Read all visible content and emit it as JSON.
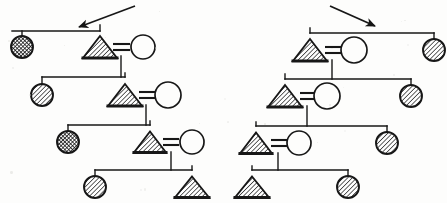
{
  "figure": {
    "background_color": "#fdfdfc",
    "ink_color": "#171717",
    "line_width": 1.4,
    "symbol_legend": [
      {
        "key": "triangle-hatched",
        "shape": "triangle",
        "fill": "diagonal-hatch",
        "meaning": "affected male"
      },
      {
        "key": "circle-open",
        "shape": "circle",
        "fill": "none",
        "meaning": "unaffected female"
      },
      {
        "key": "circle-hatched",
        "shape": "circle",
        "fill": "diagonal-hatch",
        "meaning": "affected female"
      },
      {
        "key": "circle-crosshatched",
        "shape": "circle",
        "fill": "cross-hatch",
        "meaning": "heavily affected female"
      }
    ],
    "mating_symbol": "=",
    "annotations": [
      {
        "name": "proband-arrow-left",
        "direction": "down-left",
        "x1": 135,
        "y1": 6,
        "x2": 79,
        "y2": 27
      },
      {
        "name": "proband-arrow-right",
        "direction": "down-right",
        "x1": 330,
        "y1": 6,
        "x2": 375,
        "y2": 26
      }
    ]
  },
  "pedigrees": [
    {
      "name": "left-pedigree",
      "cascade": "down-right",
      "generations": [
        {
          "label": "I",
          "sibship_line": {
            "x1": 12,
            "x2": 100,
            "y": 31
          },
          "members": [
            {
              "name": "gen1-female-hatched",
              "symbol": "circle-crosshatched",
              "cx": 22,
              "cy": 47,
              "r": 11,
              "drop_from": 31
            },
            {
              "name": "gen1-male-affected",
              "symbol": "triangle-hatched",
              "cx": 100,
              "cy": 47,
              "half_w": 17,
              "h": 22,
              "drop_from": 31
            },
            {
              "name": "gen1-mate-female",
              "symbol": "circle-open",
              "cx": 143,
              "cy": 47,
              "r": 12
            }
          ],
          "mating": {
            "name": "mating-bar-gen1",
            "x1": 113,
            "x2": 130,
            "y": 47,
            "label": "="
          },
          "descent": {
            "x": 121,
            "y1": 56,
            "y2": 77
          }
        },
        {
          "label": "II",
          "sibship_line": {
            "x1": 42,
            "x2": 125,
            "y": 77
          },
          "members": [
            {
              "name": "gen2-female-affected",
              "symbol": "circle-hatched",
              "cx": 42,
              "cy": 95,
              "r": 11,
              "drop_from": 77
            },
            {
              "name": "gen2-male-affected",
              "symbol": "triangle-hatched",
              "cx": 125,
              "cy": 95,
              "half_w": 17,
              "h": 22,
              "drop_from": 77
            },
            {
              "name": "gen2-mate-female",
              "symbol": "circle-open",
              "cx": 168,
              "cy": 95,
              "r": 13
            }
          ],
          "mating": {
            "name": "mating-bar-gen2",
            "x1": 139,
            "x2": 155,
            "y": 95,
            "label": "="
          },
          "descent": {
            "x": 146,
            "y1": 105,
            "y2": 125
          }
        },
        {
          "label": "III",
          "sibship_line": {
            "x1": 68,
            "x2": 150,
            "y": 125
          },
          "members": [
            {
              "name": "gen3-female-affected",
              "symbol": "circle-crosshatched",
              "cx": 68,
              "cy": 142,
              "r": 11,
              "drop_from": 125
            },
            {
              "name": "gen3-male-affected",
              "symbol": "triangle-hatched",
              "cx": 150,
              "cy": 142,
              "half_w": 16,
              "h": 21,
              "drop_from": 125
            },
            {
              "name": "gen3-mate-female",
              "symbol": "circle-open",
              "cx": 192,
              "cy": 142,
              "r": 12
            }
          ],
          "mating": {
            "name": "mating-bar-gen3",
            "x1": 163,
            "x2": 179,
            "y": 142,
            "label": "="
          },
          "descent": {
            "x": 171,
            "y1": 152,
            "y2": 170
          }
        },
        {
          "label": "IV",
          "sibship_line": {
            "x1": 95,
            "x2": 192,
            "y": 170
          },
          "members": [
            {
              "name": "gen4-female-affected",
              "symbol": "circle-hatched",
              "cx": 95,
              "cy": 187,
              "r": 11,
              "drop_from": 170
            },
            {
              "name": "gen4-male-affected",
              "symbol": "triangle-hatched",
              "cx": 192,
              "cy": 187,
              "half_w": 17,
              "h": 21,
              "drop_from": 170
            }
          ]
        }
      ]
    },
    {
      "name": "right-pedigree",
      "cascade": "down-left",
      "generations": [
        {
          "label": "I",
          "sibship_line": {
            "x1": 310,
            "x2": 434,
            "y": 33
          },
          "members": [
            {
              "name": "gen1-male-affected",
              "symbol": "triangle-hatched",
              "cx": 310,
              "cy": 50,
              "half_w": 17,
              "h": 22,
              "drop_from": 33
            },
            {
              "name": "gen1-mate-female",
              "symbol": "circle-open",
              "cx": 354,
              "cy": 50,
              "r": 13
            },
            {
              "name": "gen1-female-affected",
              "symbol": "circle-hatched",
              "cx": 434,
              "cy": 50,
              "r": 11,
              "drop_from": 33
            }
          ],
          "mating": {
            "name": "mating-bar-gen1",
            "x1": 325,
            "x2": 341,
            "y": 50,
            "label": "="
          },
          "descent": {
            "x": 332,
            "y1": 60,
            "y2": 79
          }
        },
        {
          "label": "II",
          "sibship_line": {
            "x1": 285,
            "x2": 411,
            "y": 79
          },
          "members": [
            {
              "name": "gen2-male-affected",
              "symbol": "triangle-hatched",
              "cx": 285,
              "cy": 96,
              "half_w": 17,
              "h": 22,
              "drop_from": 79
            },
            {
              "name": "gen2-mate-female",
              "symbol": "circle-open",
              "cx": 327,
              "cy": 96,
              "r": 13
            },
            {
              "name": "gen2-female-affected",
              "symbol": "circle-hatched",
              "cx": 411,
              "cy": 96,
              "r": 11,
              "drop_from": 79
            }
          ],
          "mating": {
            "name": "mating-bar-gen2",
            "x1": 300,
            "x2": 315,
            "y": 96,
            "label": "="
          },
          "descent": {
            "x": 307,
            "y1": 106,
            "y2": 126
          }
        },
        {
          "label": "III",
          "sibship_line": {
            "x1": 256,
            "x2": 387,
            "y": 126
          },
          "members": [
            {
              "name": "gen3-male-affected",
              "symbol": "triangle-hatched",
              "cx": 256,
              "cy": 143,
              "half_w": 16,
              "h": 21,
              "drop_from": 126
            },
            {
              "name": "gen3-mate-female",
              "symbol": "circle-open",
              "cx": 299,
              "cy": 143,
              "r": 12
            },
            {
              "name": "gen3-female-affected",
              "symbol": "circle-hatched",
              "cx": 387,
              "cy": 143,
              "r": 11,
              "drop_from": 126
            }
          ],
          "mating": {
            "name": "mating-bar-gen3",
            "x1": 271,
            "x2": 287,
            "y": 143,
            "label": "="
          },
          "descent": {
            "x": 278,
            "y1": 153,
            "y2": 170
          }
        },
        {
          "label": "IV",
          "sibship_line": {
            "x1": 252,
            "x2": 348,
            "y": 170
          },
          "members": [
            {
              "name": "gen4-male-affected",
              "symbol": "triangle-hatched",
              "cx": 252,
              "cy": 187,
              "half_w": 17,
              "h": 21,
              "drop_from": 170
            },
            {
              "name": "gen4-female-affected",
              "symbol": "circle-hatched",
              "cx": 348,
              "cy": 187,
              "r": 11,
              "drop_from": 170
            }
          ]
        }
      ]
    }
  ]
}
